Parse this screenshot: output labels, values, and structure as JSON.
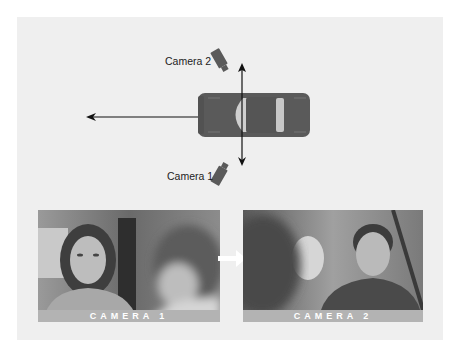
{
  "diagram": {
    "camera_labels": [
      {
        "id": "camera2",
        "text": "Camera 2"
      },
      {
        "id": "camera1",
        "text": "Camera 1"
      }
    ],
    "axis_of_action": "horizontal arrow left from car (direction of travel)",
    "camera_axis": "vertical double-headed arrow crossing car"
  },
  "photos": [
    {
      "caption": "CAMERA 1",
      "subject": "young woman in car, boy's head blurred in foreground right"
    },
    {
      "caption": "CAMERA 2",
      "subject": "young man in car, blurred head in foreground left"
    }
  ],
  "colors": {
    "panel": "#efefef",
    "car_body": "#5a5a5a",
    "windshield": "#c8c8c8",
    "band": "#b3b3b3",
    "arrow": "#111111",
    "transition_arrow": "#ffffff"
  }
}
